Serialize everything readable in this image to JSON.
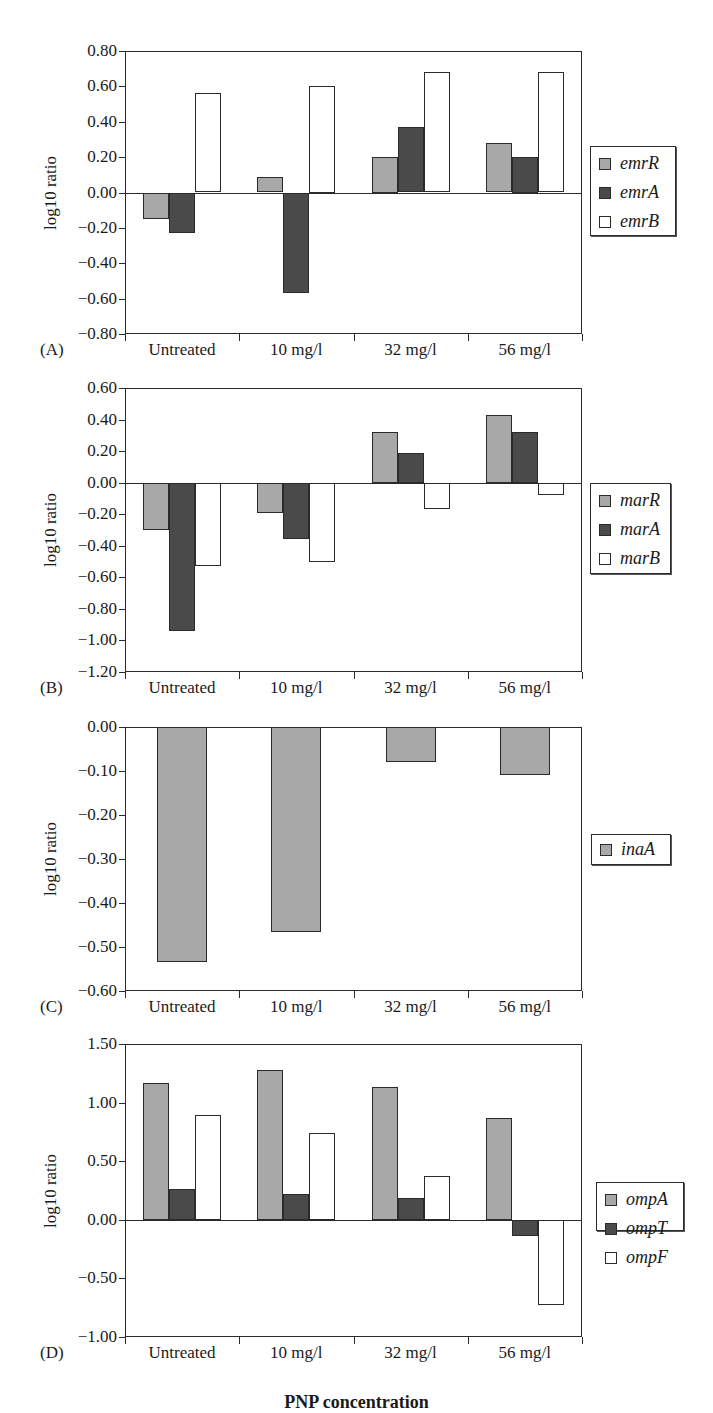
{
  "figure": {
    "xaxis_title": "PNP concentration",
    "colors": {
      "light": "#a8a8a8",
      "dark": "#4a4a4a",
      "white": "#ffffff",
      "axis": "#2a2a2a"
    }
  },
  "chart_data": [
    {
      "panel": "(A)",
      "type": "bar",
      "title": "",
      "xlabel": "",
      "ylabel": "log10 ratio",
      "ylim": [
        -0.8,
        0.8
      ],
      "yticks": [
        "0.80",
        "0.60",
        "0.40",
        "0.20",
        "0.00",
        "-0.20",
        "-0.40",
        "-0.60",
        "-0.80"
      ],
      "ytick_values": [
        0.8,
        0.6,
        0.4,
        0.2,
        0.0,
        -0.2,
        -0.4,
        -0.6,
        -0.8
      ],
      "categories": [
        "Untreated",
        "10 mg/l",
        "32 mg/l",
        "56 mg/l"
      ],
      "series": [
        {
          "name": "emrR",
          "color": "#a8a8a8",
          "values": [
            -0.15,
            0.09,
            0.2,
            0.28
          ]
        },
        {
          "name": "emrA",
          "color": "#4a4a4a",
          "values": [
            -0.23,
            -0.57,
            0.37,
            0.2
          ]
        },
        {
          "name": "emrB",
          "color": "#ffffff",
          "values": [
            0.56,
            0.6,
            0.68,
            0.68
          ]
        }
      ],
      "grid": false,
      "legend_position": "right"
    },
    {
      "panel": "(B)",
      "type": "bar",
      "title": "",
      "xlabel": "",
      "ylabel": "log10 ratio",
      "ylim": [
        -1.2,
        0.6
      ],
      "yticks": [
        "0.60",
        "0.40",
        "0.20",
        "0.00",
        "-0.20",
        "-0.40",
        "-0.60",
        "-0.80",
        "-1.00",
        "-1.20"
      ],
      "ytick_values": [
        0.6,
        0.4,
        0.2,
        0.0,
        -0.2,
        -0.4,
        -0.6,
        -0.8,
        -1.0,
        -1.2
      ],
      "categories": [
        "Untreated",
        "10 mg/l",
        "32 mg/l",
        "56 mg/l"
      ],
      "series": [
        {
          "name": "marR",
          "color": "#a8a8a8",
          "values": [
            -0.3,
            -0.19,
            0.32,
            0.43
          ]
        },
        {
          "name": "marA",
          "color": "#4a4a4a",
          "values": [
            -0.94,
            -0.36,
            0.19,
            0.32
          ]
        },
        {
          "name": "marB",
          "color": "#ffffff",
          "values": [
            -0.53,
            -0.5,
            -0.17,
            -0.08
          ]
        }
      ],
      "grid": false,
      "legend_position": "right"
    },
    {
      "panel": "(C)",
      "type": "bar",
      "title": "",
      "xlabel": "",
      "ylabel": "log10 ratio",
      "ylim": [
        -0.6,
        0.0
      ],
      "yticks": [
        "0.00",
        "-0.10",
        "-0.20",
        "-0.30",
        "-0.40",
        "-0.50",
        "-0.60"
      ],
      "ytick_values": [
        0.0,
        -0.1,
        -0.2,
        -0.3,
        -0.4,
        -0.5,
        -0.6
      ],
      "categories": [
        "Untreated",
        "10 mg/l",
        "32 mg/l",
        "56 mg/l"
      ],
      "series": [
        {
          "name": "inaA",
          "color": "#a8a8a8",
          "values": [
            -0.535,
            -0.465,
            -0.08,
            -0.11
          ]
        }
      ],
      "grid": false,
      "legend_position": "right"
    },
    {
      "panel": "(D)",
      "type": "bar",
      "title": "",
      "xlabel": "PNP concentration",
      "ylabel": "log10 ratio",
      "ylim": [
        -1.0,
        1.5
      ],
      "yticks": [
        "1.50",
        "1.00",
        "0.50",
        "0.00",
        "-0.50",
        "-1.00"
      ],
      "ytick_values": [
        1.5,
        1.0,
        0.5,
        0.0,
        -0.5,
        -1.0
      ],
      "categories": [
        "Untreated",
        "10 mg/l",
        "32 mg/l",
        "56 mg/l"
      ],
      "series": [
        {
          "name": "ompA",
          "color": "#a8a8a8",
          "values": [
            1.17,
            1.28,
            1.13,
            0.87
          ]
        },
        {
          "name": "ompT",
          "color": "#4a4a4a",
          "values": [
            0.26,
            0.22,
            0.19,
            -0.14
          ]
        },
        {
          "name": "ompF",
          "color": "#ffffff",
          "values": [
            0.89,
            0.74,
            0.37,
            -0.73
          ]
        }
      ],
      "grid": false,
      "legend_position": "right"
    }
  ]
}
